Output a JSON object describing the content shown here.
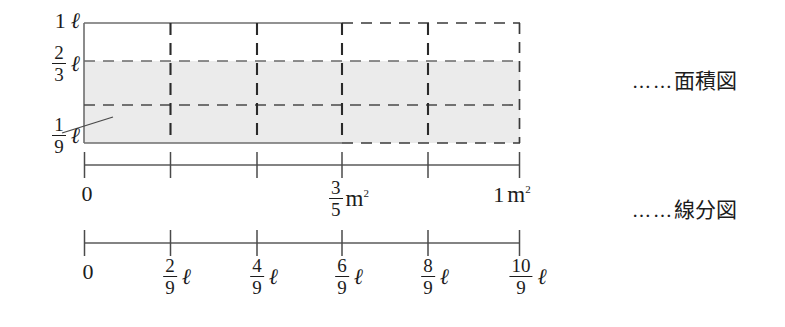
{
  "figure": {
    "type": "math-diagram",
    "area_model": {
      "y_labels": [
        {
          "id": "y-top",
          "whole": "1",
          "unit": "ℓ"
        },
        {
          "id": "y-twothirds",
          "num": "2",
          "den": "3",
          "unit": "ℓ"
        },
        {
          "id": "y-oneninth",
          "num": "1",
          "den": "9",
          "unit": "ℓ"
        }
      ],
      "x_axis_labels": [
        {
          "id": "x-zero",
          "text": "0"
        },
        {
          "id": "x-threefifths",
          "num": "3",
          "den": "5",
          "unit": "m",
          "sup": "2"
        },
        {
          "id": "x-one",
          "whole": "1",
          "unit": "m",
          "sup": "2"
        }
      ]
    },
    "number_line": {
      "ticks": [
        {
          "id": "n-0",
          "text": "0"
        },
        {
          "id": "n-2-9",
          "num": "2",
          "den": "9",
          "unit": "ℓ"
        },
        {
          "id": "n-4-9",
          "num": "4",
          "den": "9",
          "unit": "ℓ"
        },
        {
          "id": "n-6-9",
          "num": "6",
          "den": "9",
          "unit": "ℓ"
        },
        {
          "id": "n-8-9",
          "num": "8",
          "den": "9",
          "unit": "ℓ"
        },
        {
          "id": "n-10-9",
          "num": "10",
          "den": "9",
          "unit": "ℓ"
        }
      ]
    },
    "annotations": [
      {
        "id": "annot-area",
        "dots": "……",
        "text": "面積図"
      },
      {
        "id": "annot-line",
        "dots": "……",
        "text": "線分図"
      }
    ],
    "colors": {
      "ink": "#1c1c1c",
      "rule": "#6e6e6e",
      "shade": "#ebebeb",
      "dash": "#2a2a2a"
    }
  }
}
